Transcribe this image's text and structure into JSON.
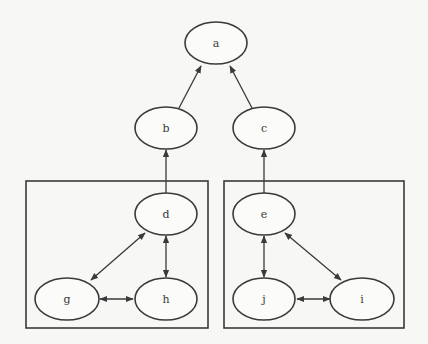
{
  "diagram": {
    "type": "directed-graph",
    "nodes": [
      {
        "id": "a",
        "label": "a",
        "cx": 216,
        "cy": 43
      },
      {
        "id": "b",
        "label": "b",
        "cx": 166,
        "cy": 128
      },
      {
        "id": "c",
        "label": "c",
        "cx": 264,
        "cy": 128
      },
      {
        "id": "d",
        "label": "d",
        "cx": 166,
        "cy": 214
      },
      {
        "id": "e",
        "label": "e",
        "cx": 264,
        "cy": 214
      },
      {
        "id": "g",
        "label": "g",
        "cx": 67,
        "cy": 299
      },
      {
        "id": "h",
        "label": "h",
        "cx": 166,
        "cy": 299
      },
      {
        "id": "j",
        "label": "j",
        "cx": 264,
        "cy": 299
      },
      {
        "id": "i",
        "label": "i",
        "cx": 362,
        "cy": 299
      }
    ],
    "edges": [
      {
        "from": "b",
        "to": "a",
        "dir": "forward"
      },
      {
        "from": "c",
        "to": "a",
        "dir": "forward"
      },
      {
        "from": "d",
        "to": "b",
        "dir": "forward"
      },
      {
        "from": "e",
        "to": "c",
        "dir": "forward"
      },
      {
        "from": "d",
        "to": "g",
        "dir": "both"
      },
      {
        "from": "d",
        "to": "h",
        "dir": "both"
      },
      {
        "from": "g",
        "to": "h",
        "dir": "both"
      },
      {
        "from": "e",
        "to": "j",
        "dir": "both"
      },
      {
        "from": "e",
        "to": "i",
        "dir": "both"
      },
      {
        "from": "j",
        "to": "i",
        "dir": "both"
      }
    ],
    "clusters": [
      {
        "id": "cluster-left",
        "members": [
          "d",
          "g",
          "h"
        ]
      },
      {
        "id": "cluster-right",
        "members": [
          "e",
          "j",
          "i"
        ]
      }
    ]
  }
}
